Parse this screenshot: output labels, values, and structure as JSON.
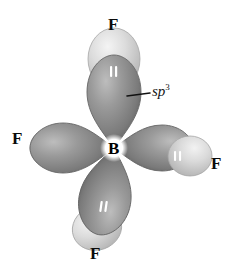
{
  "figure": {
    "type": "orbital-hybridization-diagram",
    "background_color": "#ffffff",
    "width": 232,
    "height": 279
  },
  "central_atom": {
    "symbol": "B",
    "x": 114,
    "y": 148
  },
  "hybrid_annotation": {
    "text": "sp",
    "superscript": "3",
    "label_x": 152,
    "label_y": 88,
    "leader_line": {
      "x1": 127,
      "y1": 96,
      "x2": 150,
      "y2": 93
    }
  },
  "colors": {
    "hybrid_orbital_dark": "#8d8d8d",
    "hybrid_orbital_shadow": "#5e5e5e",
    "hybrid_orbital_highlight": "#c0c0c0",
    "fluorine_orbital_light": "#d2d2d2",
    "fluorine_orbital_highlight": "#efefef",
    "fluorine_orbital_edge": "#a8a8a8",
    "outline": "#6b6b6b",
    "electron_pair_mark": "#ffffff",
    "text": "#0a0a0a"
  },
  "lobes": [
    {
      "id": "lobe-top",
      "direction": "up",
      "angle_deg": -90,
      "hybrid_label": "sp3",
      "electron_pair": true,
      "fluorine": {
        "symbol": "F",
        "label_x": 114,
        "label_y": 24
      }
    },
    {
      "id": "lobe-right",
      "direction": "right",
      "angle_deg": 0,
      "hybrid_label": "sp3",
      "electron_pair": true,
      "fluorine": {
        "symbol": "F",
        "label_x": 216,
        "label_y": 163
      }
    },
    {
      "id": "lobe-bottom",
      "direction": "down",
      "angle_deg": 100,
      "hybrid_label": "sp3",
      "electron_pair": true,
      "fluorine": {
        "symbol": "F",
        "label_x": 95,
        "label_y": 252
      }
    },
    {
      "id": "lobe-left",
      "direction": "left",
      "angle_deg": 180,
      "hybrid_label": "sp3",
      "electron_pair": true,
      "fluorine": {
        "symbol": "F",
        "label_x": 17,
        "label_y": 137
      }
    }
  ],
  "labels": {
    "fluorine_top": "F",
    "fluorine_right": "F",
    "fluorine_bottom": "F",
    "fluorine_left": "F",
    "boron_center": "B"
  }
}
